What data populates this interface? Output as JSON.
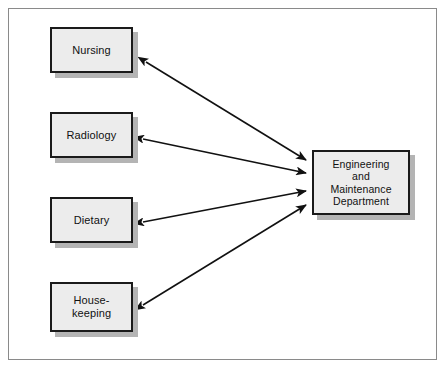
{
  "diagram": {
    "frame": {
      "name": "outer-border",
      "color": "#8a8a8a"
    },
    "style": {
      "box_fill": "#ececec",
      "box_border": "#1a1a1a",
      "box_shadow": "#b4b4b4",
      "arrow_color": "#111111",
      "background": "#ffffff"
    },
    "departments": [
      {
        "id": "nursing",
        "label": "Nursing",
        "x": 50,
        "y": 27,
        "w": 83,
        "h": 46
      },
      {
        "id": "radiology",
        "label": "Radiology",
        "x": 50,
        "y": 112,
        "w": 83,
        "h": 46
      },
      {
        "id": "dietary",
        "label": "Dietary",
        "x": 50,
        "y": 197,
        "w": 83,
        "h": 46
      },
      {
        "id": "housekeeping",
        "label": "House-\nkeeping",
        "x": 50,
        "y": 282,
        "w": 83,
        "h": 50
      }
    ],
    "central": {
      "id": "engineering-maintenance",
      "label": "Engineering\nand\nMaintenance\nDepartment",
      "x": 312,
      "y": 150,
      "w": 98,
      "h": 65
    },
    "connectors": [
      {
        "id": "nursing-to-department",
        "from": "nursing",
        "to": "engineering-maintenance",
        "type": "double-headed-arrow",
        "x1": 146,
        "y1": 62,
        "x2": 306,
        "y2": 160
      },
      {
        "id": "radiology-to-department",
        "from": "radiology",
        "to": "engineering-maintenance",
        "type": "double-headed-arrow",
        "x1": 143,
        "y1": 139,
        "x2": 306,
        "y2": 173
      },
      {
        "id": "dietary-to-department",
        "from": "dietary",
        "to": "engineering-maintenance",
        "type": "double-headed-arrow",
        "x1": 143,
        "y1": 222,
        "x2": 306,
        "y2": 191
      },
      {
        "id": "housekeeping-to-department",
        "from": "housekeeping",
        "to": "engineering-maintenance",
        "type": "double-headed-arrow",
        "x1": 143,
        "y1": 305,
        "x2": 306,
        "y2": 205
      }
    ]
  }
}
